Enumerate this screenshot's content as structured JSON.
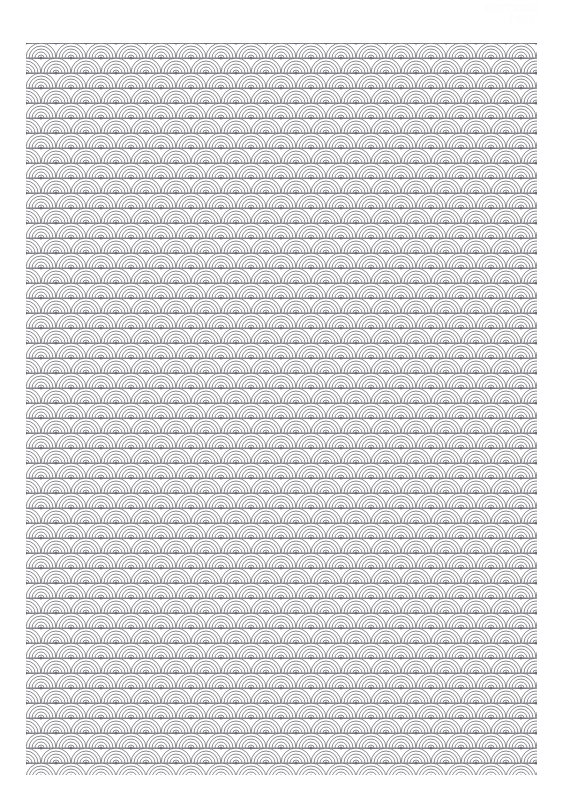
{
  "page": {
    "width": 562,
    "height": 803,
    "background_color": "#ffffff",
    "document_type": "pattern-coloring-page"
  },
  "watermark": {
    "name": "corner-watermark",
    "line1": "PATTERN",
    "line2": "PAGE",
    "color": "#fdfdfe",
    "legible": false,
    "position": "top-right"
  },
  "artwork": {
    "title": "Seigaiha",
    "alt_title": "Blue Ocean Wave Pattern",
    "motif_name": "seigaiha-wave-fan",
    "description": "Repeating overlapping concentric arc fans arranged in offset rows",
    "line_color": "#6b6b72",
    "fill_color": "#ffffff",
    "stroke_width": 0.8,
    "area": {
      "left": 26,
      "top": 43,
      "width": 511,
      "height": 732
    },
    "geometry": {
      "motif_width": 30,
      "motif_height": 30,
      "row_step": 15,
      "column_step": 30,
      "row_offset": 15,
      "arcs_per_motif": 5,
      "center_dot_radius": 1.6,
      "columns": 19,
      "rows": 50
    }
  }
}
